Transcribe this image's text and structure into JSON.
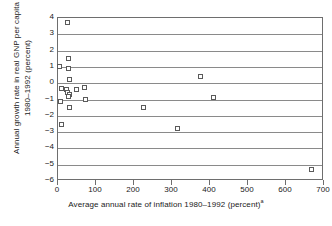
{
  "chart_data": {
    "type": "scatter",
    "title": "",
    "xlabel": "Average annual rate of inflation 1980–1992 (percent)",
    "xlabel_footnote": "a",
    "ylabel_line1": "Annual growth rate in real GNP per capita",
    "ylabel_line2": "1980–1992 (percent)",
    "xlim": [
      0,
      700
    ],
    "ylim": [
      -6,
      4
    ],
    "xticks": [
      0,
      100,
      200,
      300,
      400,
      500,
      600,
      700
    ],
    "xtick_labels": [
      "0",
      "100",
      "200",
      "300",
      "400",
      "500",
      "600",
      "700"
    ],
    "yticks": [
      4,
      3,
      2,
      1,
      0,
      -1,
      -2,
      -3,
      -4,
      -5,
      -6
    ],
    "ytick_labels": [
      "4",
      "3",
      "2",
      "1",
      "0",
      "−1",
      "−2",
      "−3",
      "−4",
      "−5",
      "−6"
    ],
    "grid": "horizontal",
    "legend": "none",
    "marker": "open-square",
    "marker_color": "#5a5a5a",
    "axis_color": "#6e6e6e",
    "grid_color": "#8a8a8a",
    "points": [
      {
        "x": 24,
        "y": 3.7
      },
      {
        "x": 27,
        "y": 1.5
      },
      {
        "x": 5,
        "y": 1.0
      },
      {
        "x": 27,
        "y": 0.9
      },
      {
        "x": 30,
        "y": 0.2
      },
      {
        "x": 8,
        "y": -0.35
      },
      {
        "x": 23,
        "y": -0.4
      },
      {
        "x": 48,
        "y": -0.4
      },
      {
        "x": 70,
        "y": -0.25
      },
      {
        "x": 26,
        "y": -0.6
      },
      {
        "x": 31,
        "y": -0.7
      },
      {
        "x": 28,
        "y": -0.8
      },
      {
        "x": 7,
        "y": -1.1
      },
      {
        "x": 72,
        "y": -1.0
      },
      {
        "x": 30,
        "y": -1.5
      },
      {
        "x": 10,
        "y": -2.55
      },
      {
        "x": 225,
        "y": -1.5
      },
      {
        "x": 315,
        "y": -2.75
      },
      {
        "x": 375,
        "y": 0.4
      },
      {
        "x": 408,
        "y": -0.85
      },
      {
        "x": 667,
        "y": -5.3
      }
    ]
  }
}
